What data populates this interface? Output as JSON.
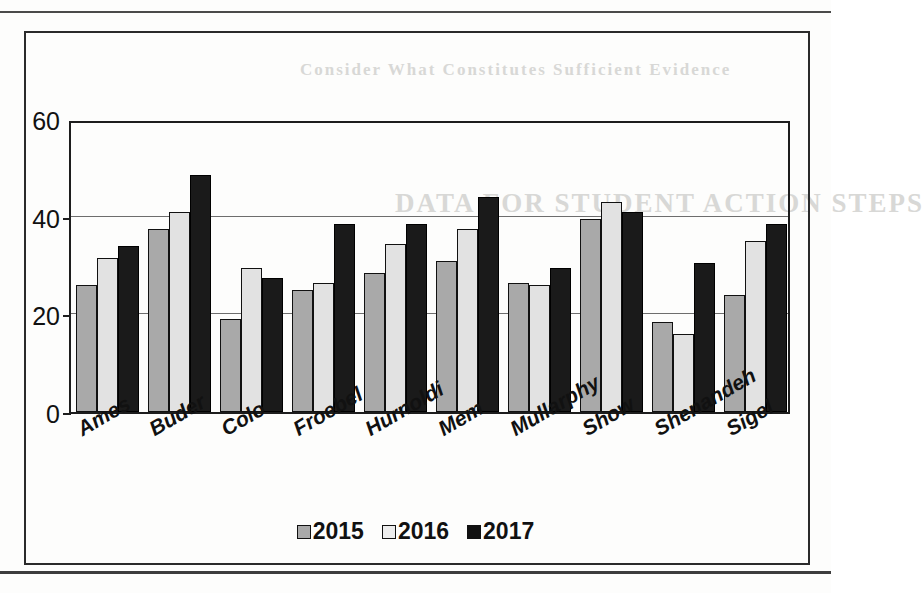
{
  "chart_data": {
    "type": "bar",
    "title": "",
    "xlabel": "",
    "ylabel": "",
    "ylim": [
      0,
      60
    ],
    "yticks": [
      0,
      20,
      40,
      60
    ],
    "grid": true,
    "legend_position": "bottom",
    "categories": [
      "Ames",
      "Buder",
      "Colo",
      "Froebel",
      "Hurnoldi",
      "Mem",
      "Mullarphy",
      "Show",
      "Shenandeh",
      "Sigel"
    ],
    "series": [
      {
        "name": "2015",
        "color": "#a9a9a9",
        "values": [
          26,
          37.5,
          19,
          25,
          28.5,
          31,
          26.5,
          39.5,
          18.5,
          24
        ]
      },
      {
        "name": "2016",
        "color": "#e2e2e2",
        "values": [
          31.5,
          41,
          29.5,
          26.5,
          34.5,
          37.5,
          26,
          43,
          16,
          35
        ]
      },
      {
        "name": "2017",
        "color": "#1a1a1a",
        "values": [
          34,
          48.5,
          27.5,
          38.5,
          38.5,
          44,
          29.5,
          41,
          30.5,
          38.5
        ]
      }
    ]
  },
  "legend": {
    "items": [
      {
        "label": "2015",
        "swatch": "s2015"
      },
      {
        "label": "2016",
        "swatch": "s2016"
      },
      {
        "label": "2017",
        "swatch": "s2017"
      }
    ]
  },
  "axes": {
    "y_tick_labels": [
      "60",
      "40",
      "20",
      "0"
    ]
  },
  "page_bleed": {
    "lines": [
      "DATA FOR STUDENT ACTION STEPS",
      "Consider What Constitutes Sufficient Evidence"
    ]
  }
}
